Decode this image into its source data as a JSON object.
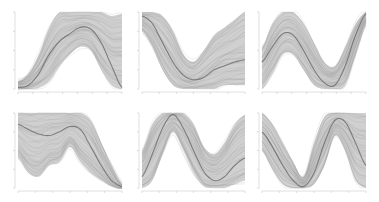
{
  "figure": {
    "width": 379,
    "height": 202,
    "colors": {
      "background": "#ffffff",
      "samples": "#9a9a9a",
      "band": "#a9a9a9",
      "mean": "#6f6f6f",
      "axis": "#d8d8d8"
    }
  },
  "chart_data": [
    {
      "type": "line",
      "panel": "row1-col1",
      "title": "",
      "xlabel": "",
      "ylabel": "",
      "frame": {
        "x": 18,
        "y": 12,
        "w": 104,
        "h": 77
      },
      "x": [
        0,
        0.1,
        0.2,
        0.3,
        0.4,
        0.5,
        0.6,
        0.7,
        0.8,
        0.9,
        1.0
      ],
      "mean": [
        0.02,
        0.05,
        0.2,
        0.45,
        0.62,
        0.72,
        0.8,
        0.78,
        0.6,
        0.3,
        0.02
      ],
      "band_upper": [
        0.1,
        0.2,
        0.45,
        0.8,
        1.0,
        1.0,
        1.0,
        1.0,
        1.0,
        0.95,
        0.98
      ],
      "band_lower": [
        0.0,
        0.0,
        0.02,
        0.1,
        0.3,
        0.45,
        0.55,
        0.5,
        0.25,
        0.05,
        0.0
      ],
      "ylim": [
        0,
        1
      ],
      "grid": false,
      "x_ticks": 8,
      "y_ticks": 5
    },
    {
      "type": "line",
      "panel": "row1-col2",
      "title": "",
      "xlabel": "",
      "ylabel": "",
      "frame": {
        "x": 142,
        "y": 12,
        "w": 103,
        "h": 77
      },
      "x": [
        0,
        0.1,
        0.2,
        0.3,
        0.4,
        0.5,
        0.6,
        0.7,
        0.8,
        0.9,
        1.0
      ],
      "mean": [
        0.95,
        0.85,
        0.6,
        0.35,
        0.18,
        0.12,
        0.15,
        0.25,
        0.3,
        0.35,
        0.38
      ],
      "band_upper": [
        1.0,
        1.0,
        0.95,
        0.75,
        0.45,
        0.35,
        0.5,
        0.7,
        0.8,
        0.9,
        1.0
      ],
      "band_lower": [
        0.75,
        0.55,
        0.25,
        0.05,
        0.0,
        0.0,
        0.0,
        0.0,
        0.05,
        0.05,
        0.05
      ],
      "ylim": [
        0,
        1
      ],
      "grid": false,
      "x_ticks": 7,
      "y_ticks": 5
    },
    {
      "type": "line",
      "panel": "row1-col3",
      "title": "",
      "xlabel": "",
      "ylabel": "",
      "frame": {
        "x": 262,
        "y": 12,
        "w": 104,
        "h": 77
      },
      "x": [
        0,
        0.1,
        0.2,
        0.3,
        0.4,
        0.5,
        0.6,
        0.7,
        0.8,
        0.9,
        1.0
      ],
      "mean": [
        0.35,
        0.55,
        0.72,
        0.7,
        0.5,
        0.25,
        0.08,
        0.05,
        0.3,
        0.7,
        0.98
      ],
      "band_upper": [
        0.55,
        0.85,
        1.0,
        1.0,
        0.85,
        0.6,
        0.35,
        0.3,
        0.55,
        0.85,
        1.0
      ],
      "band_lower": [
        0.0,
        0.2,
        0.45,
        0.45,
        0.25,
        0.05,
        0.0,
        0.0,
        0.05,
        0.45,
        0.85
      ],
      "ylim": [
        0,
        1
      ],
      "grid": false,
      "x_ticks": 8,
      "y_ticks": 3
    },
    {
      "type": "line",
      "panel": "row2-col1",
      "title": "",
      "xlabel": "",
      "ylabel": "",
      "frame": {
        "x": 18,
        "y": 113,
        "w": 104,
        "h": 75
      },
      "x": [
        0,
        0.1,
        0.2,
        0.3,
        0.4,
        0.5,
        0.6,
        0.7,
        0.8,
        0.9,
        1.0
      ],
      "mean": [
        0.85,
        0.78,
        0.72,
        0.7,
        0.75,
        0.82,
        0.78,
        0.55,
        0.3,
        0.1,
        0.02
      ],
      "band_upper": [
        1.0,
        1.0,
        1.0,
        1.0,
        1.0,
        1.0,
        1.0,
        0.9,
        0.6,
        0.3,
        0.05
      ],
      "band_lower": [
        0.4,
        0.2,
        0.15,
        0.3,
        0.35,
        0.55,
        0.35,
        0.2,
        0.1,
        0.02,
        0.0
      ],
      "ylim": [
        0,
        1
      ],
      "grid": false,
      "x_ticks": 7,
      "y_ticks": 5
    },
    {
      "type": "line",
      "panel": "row2-col2",
      "title": "",
      "xlabel": "",
      "ylabel": "",
      "frame": {
        "x": 142,
        "y": 113,
        "w": 103,
        "h": 75
      },
      "x": [
        0,
        0.1,
        0.2,
        0.3,
        0.4,
        0.5,
        0.6,
        0.7,
        0.8,
        0.9,
        1.0
      ],
      "mean": [
        0.15,
        0.45,
        0.8,
        0.98,
        0.8,
        0.5,
        0.22,
        0.1,
        0.15,
        0.3,
        0.4
      ],
      "band_upper": [
        0.5,
        0.85,
        1.0,
        1.0,
        1.0,
        0.85,
        0.55,
        0.45,
        0.6,
        0.85,
        0.98
      ],
      "band_lower": [
        0.0,
        0.1,
        0.45,
        0.75,
        0.5,
        0.2,
        0.02,
        0.0,
        0.0,
        0.05,
        0.1
      ],
      "ylim": [
        0,
        1
      ],
      "grid": false,
      "x_ticks": 7,
      "y_ticks": 5
    },
    {
      "type": "line",
      "panel": "row2-col3",
      "title": "",
      "xlabel": "",
      "ylabel": "",
      "frame": {
        "x": 262,
        "y": 113,
        "w": 104,
        "h": 75
      },
      "x": [
        0,
        0.1,
        0.2,
        0.3,
        0.4,
        0.5,
        0.6,
        0.7,
        0.8,
        0.9,
        1.0
      ],
      "mean": [
        0.75,
        0.55,
        0.3,
        0.1,
        0.02,
        0.2,
        0.6,
        0.9,
        0.88,
        0.6,
        0.3
      ],
      "band_upper": [
        1.0,
        0.85,
        0.6,
        0.35,
        0.15,
        0.6,
        0.95,
        1.0,
        1.0,
        1.0,
        1.0
      ],
      "band_lower": [
        0.5,
        0.25,
        0.05,
        0.0,
        0.0,
        0.05,
        0.3,
        0.7,
        0.5,
        0.1,
        0.0
      ],
      "ylim": [
        0,
        1
      ],
      "grid": false,
      "x_ticks": 7,
      "y_ticks": 5
    }
  ]
}
